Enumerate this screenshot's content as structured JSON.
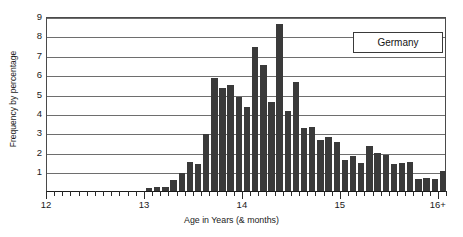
{
  "chart_data": {
    "type": "bar",
    "title": "",
    "xlabel": "Age in Years (& months)",
    "ylabel": "Frequency by percentage",
    "legend": "Germany",
    "legend_position": "top-right",
    "grid": true,
    "xlim": [
      12,
      16.0833
    ],
    "ylim": [
      0,
      9
    ],
    "yticks": [
      9,
      8,
      7,
      6,
      5,
      4,
      3,
      2,
      1
    ],
    "xticks_major": [
      {
        "value": 12,
        "label": "12"
      },
      {
        "value": 13,
        "label": "13"
      },
      {
        "value": 14,
        "label": "14"
      },
      {
        "value": 15,
        "label": "15"
      },
      {
        "value": 16,
        "label": "16+"
      }
    ],
    "x_tick_interval_months": 1,
    "bar_unit": "age in years and months (one bar per month)",
    "categories": [
      "12.0",
      "12.1",
      "12.2",
      "12.3",
      "12.4",
      "12.5",
      "12.6",
      "12.7",
      "12.8",
      "12.9",
      "12.10",
      "12.11",
      "13.0",
      "13.1",
      "13.2",
      "13.3",
      "13.4",
      "13.5",
      "13.6",
      "13.7",
      "13.8",
      "13.9",
      "13.10",
      "13.11",
      "14.0",
      "14.1",
      "14.2",
      "14.3",
      "14.4",
      "14.5",
      "14.6",
      "14.7",
      "14.8",
      "14.9",
      "14.10",
      "14.11",
      "15.0",
      "15.1",
      "15.2",
      "15.3",
      "15.4",
      "15.5",
      "15.6",
      "15.7",
      "15.8",
      "15.9",
      "15.10",
      "15.11",
      "16+"
    ],
    "values": [
      0,
      0,
      0,
      0,
      0,
      0,
      0,
      0,
      0,
      0,
      0,
      0,
      0.15,
      0.2,
      0.2,
      0.55,
      0.9,
      1.45,
      1.35,
      2.9,
      5.8,
      5.3,
      5.45,
      4.8,
      4.3,
      7.4,
      6.45,
      4.55,
      8.6,
      4.1,
      5.6,
      3.25,
      3.3,
      2.6,
      2.75,
      2.5,
      1.55,
      1.8,
      1.4,
      2.3,
      1.95,
      1.85,
      1.35,
      1.4,
      1.45,
      0.6,
      0.65,
      0.6,
      1.0
    ]
  }
}
